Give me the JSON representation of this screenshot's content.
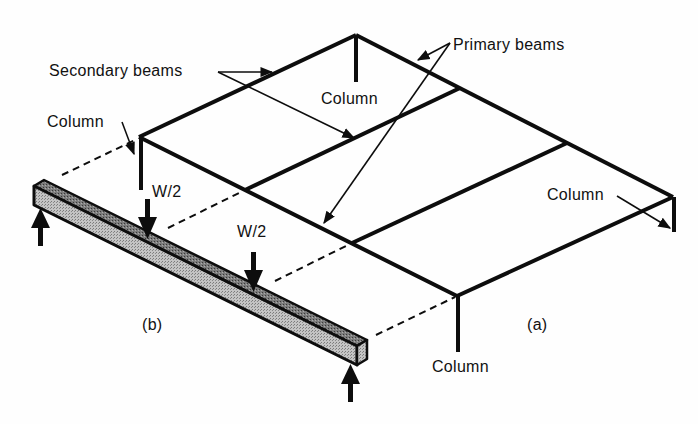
{
  "diagram": {
    "labels": {
      "secondary_beams": "Secondary beams",
      "primary_beams": "Primary beams",
      "column_left": "Column",
      "column_back": "Column",
      "column_right": "Column",
      "column_front": "Column",
      "load_1": "W/2",
      "load_2": "W/2",
      "part_b": "(b)",
      "part_a": "(a)"
    },
    "colors": {
      "line": "#0d0d0d",
      "beam_top": "#6f6f6f",
      "beam_side": "#b4b4b4",
      "beam_end": "#9a9a9a"
    }
  }
}
